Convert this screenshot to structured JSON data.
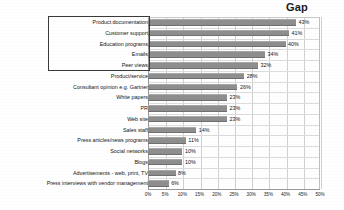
{
  "chart_data": {
    "type": "bar",
    "orientation": "horizontal",
    "title": "Gap",
    "xlabel": "",
    "ylabel": "",
    "xlim": [
      0,
      50
    ],
    "grid": true,
    "legend": null,
    "value_suffix": "%",
    "categories": [
      "Product documentation",
      "Customer support",
      "Education programs",
      "Emails",
      "Peer views",
      "Product/service",
      "Consultant opinion e.g. Gartner",
      "White papers",
      "PR",
      "Web site",
      "Sales staff",
      "Press articles/news programs",
      "Social networks",
      "Blogs",
      "Advertisements - web, print, TV",
      "Press interviews with vendor management"
    ],
    "values": [
      43,
      41,
      40,
      34,
      32,
      28,
      26,
      23,
      23,
      23,
      14,
      11,
      10,
      10,
      8,
      6
    ],
    "value_labels": [
      "43%",
      "41%",
      "40%",
      "34%",
      "32%",
      "28%",
      "26%",
      "23%",
      "23%",
      "23%",
      "14%",
      "11%",
      "10%",
      "10%",
      "8%",
      "6%"
    ],
    "xticks": [
      0,
      5,
      10,
      15,
      20,
      25,
      30,
      35,
      40,
      45,
      50
    ],
    "xticklabels": [
      "0%",
      "5%",
      "10%",
      "15%",
      "20%",
      "25%",
      "30%",
      "35%",
      "40%",
      "45%",
      "50%"
    ],
    "highlight": {
      "label": "top-five-highlight",
      "categories": [
        "Product documentation",
        "Customer support",
        "Education programs",
        "Emails",
        "Peer views"
      ]
    },
    "colors": {
      "bar": "#8e8e8e",
      "grid": "#d0d0d0",
      "axis": "#9a9a9a",
      "text": "#141414",
      "highlight_border": "#3a3a3a",
      "background": "#ffffff"
    }
  }
}
